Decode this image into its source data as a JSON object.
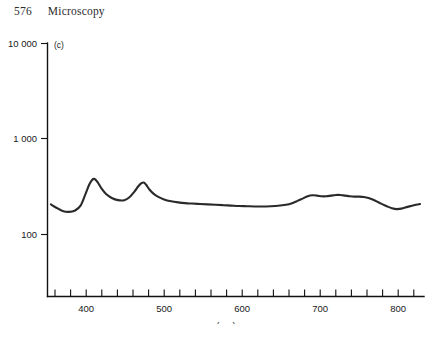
{
  "page": {
    "folio": "576",
    "running_head": "Microscopy"
  },
  "figure": {
    "panel_label": "(c)",
    "caption": ""
  },
  "chart_data": {
    "type": "line",
    "title": "",
    "subtitle": "",
    "panel": "(c)",
    "xlabel": "(nm)",
    "ylabel": "",
    "xscale": "linear",
    "yscale": "log",
    "xlim": [
      350,
      830
    ],
    "ylim": [
      40,
      10000
    ],
    "grid": false,
    "legend": null,
    "xticks_major": [
      400,
      500,
      600,
      700,
      800
    ],
    "xtick_labels": [
      "400",
      "500",
      "600",
      "700",
      "800"
    ],
    "xticks_minor_step": 20,
    "yticks": [
      100,
      1000,
      10000
    ],
    "ytick_labels": [
      "100",
      "1 000",
      "10 000"
    ],
    "series": [
      {
        "name": "spectrum",
        "color": "#2a2a2a",
        "x": [
          355,
          362,
          370,
          378,
          386,
          393,
          399,
          404,
          408,
          411,
          415,
          420,
          426,
          433,
          441,
          449,
          456,
          462,
          467,
          471,
          474,
          477,
          481,
          486,
          492,
          500,
          509,
          518,
          527,
          536,
          546,
          556,
          566,
          576,
          586,
          596,
          606,
          616,
          626,
          636,
          646,
          656,
          664,
          671,
          678,
          684,
          690,
          696,
          702,
          708,
          714,
          720,
          726,
          732,
          738,
          744,
          750,
          756,
          762,
          768,
          774,
          780,
          786,
          792,
          798,
          804,
          812,
          820,
          828
        ],
        "y": [
          206,
          190,
          176,
          172,
          178,
          200,
          260,
          330,
          372,
          378,
          350,
          300,
          262,
          240,
          228,
          228,
          246,
          280,
          318,
          342,
          348,
          330,
          296,
          268,
          248,
          232,
          222,
          216,
          212,
          210,
          208,
          206,
          204,
          202,
          200,
          198,
          197,
          196,
          196,
          197,
          199,
          204,
          212,
          224,
          238,
          250,
          256,
          254,
          250,
          250,
          254,
          258,
          258,
          254,
          250,
          248,
          248,
          246,
          240,
          230,
          218,
          206,
          196,
          188,
          184,
          186,
          194,
          202,
          208
        ]
      }
    ],
    "features": {
      "peak_1_nm": 410,
      "peak_1_value": 378,
      "peak_2_nm": 474,
      "peak_2_value": 348,
      "broad_band_nm": [
        680,
        750
      ],
      "minimum_nm": 798,
      "minimum_value": 184
    }
  },
  "axes_geometry": {
    "plot_left_px": 47,
    "plot_bottom_px": 272,
    "plot_right_px": 424,
    "plot_top_px": 19,
    "x_nm_at_left": 350,
    "x_nm_at_right": 833,
    "y_decade_px": 96
  }
}
